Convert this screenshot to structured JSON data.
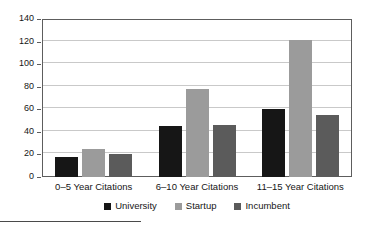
{
  "chart_data": {
    "type": "bar",
    "title": "",
    "subtitle": "",
    "xlabel": "",
    "ylabel": "",
    "categories": [
      "0–5 Year Citations",
      "6–10 Year Citations",
      "11–15 Year Citations"
    ],
    "series": [
      {
        "name": "University",
        "color": "#161616",
        "values": [
          18,
          45,
          60
        ]
      },
      {
        "name": "Startup",
        "color": "#9b9b9b",
        "values": [
          25,
          78,
          121
        ]
      },
      {
        "name": "Incumbent",
        "color": "#5b5b5b",
        "values": [
          20,
          46,
          55
        ]
      }
    ],
    "ylim": [
      0,
      140
    ],
    "yticks": [
      0,
      20,
      40,
      60,
      80,
      100,
      120,
      140
    ],
    "ytick_labels": [
      "0",
      "20",
      "40",
      "60",
      "80",
      "100",
      "120",
      "140"
    ],
    "grid": "horizontal",
    "legend_position": "bottom-center",
    "annotations": []
  },
  "legend": {
    "items": [
      {
        "label": "University",
        "swatch": "university"
      },
      {
        "label": "Startup",
        "swatch": "startup"
      },
      {
        "label": "Incumbent",
        "swatch": "incumbent"
      }
    ]
  },
  "colors": {
    "university": "#161616",
    "startup": "#9b9b9b",
    "incumbent": "#5b5b5b",
    "axis": "#5d5d5d",
    "gridline": "#c9c9c9",
    "background": "#ffffff"
  }
}
